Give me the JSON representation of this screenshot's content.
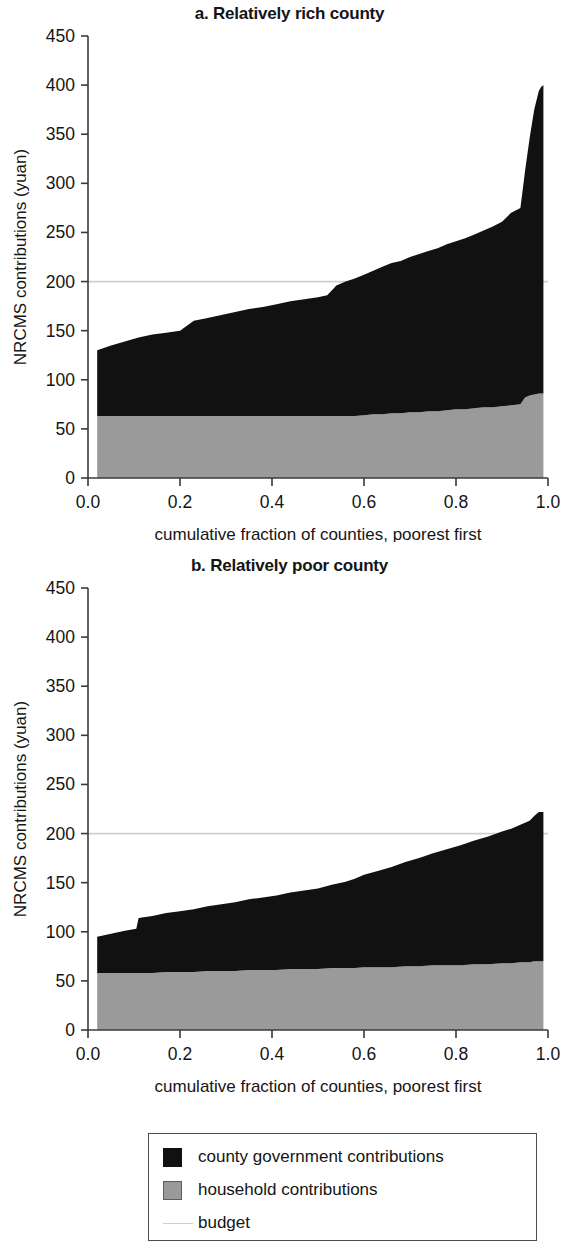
{
  "figure": {
    "background": "#ffffff"
  },
  "colors": {
    "government": "#111111",
    "household": "#9a9a9a",
    "budget": "#cfcfcf",
    "axis": "#3a3a3a",
    "text": "#151515"
  },
  "legend": {
    "items": [
      {
        "label": "county government contributions",
        "swatch": "black-square-swatch",
        "color": "#111111"
      },
      {
        "label": "household contributions",
        "swatch": "gray-square-swatch",
        "color": "#9a9a9a"
      },
      {
        "label": "budget",
        "swatch": "light-gray-line-swatch",
        "color": "#cfcfcf"
      }
    ]
  },
  "panels": [
    {
      "id": "a",
      "title": "a. Relatively rich county",
      "xlabel": "cumulative fraction of counties, poorest first",
      "ylabel": "NRCMS contributions (yuan)"
    },
    {
      "id": "b",
      "title": "b. Relatively poor county",
      "xlabel": "cumulative fraction of counties, poorest first",
      "ylabel": "NRCMS contributions (yuan)"
    }
  ],
  "axes": {
    "y_ticks": [
      "0",
      "50",
      "100",
      "150",
      "200",
      "250",
      "300",
      "350",
      "400",
      "450"
    ],
    "y_tick_values": [
      0,
      50,
      100,
      150,
      200,
      250,
      300,
      350,
      400,
      450
    ],
    "x_ticks": [
      "0.0",
      "0.2",
      "0.4",
      "0.6",
      "0.8",
      "1.0"
    ],
    "x_tick_values": [
      0.0,
      0.2,
      0.4,
      0.6,
      0.8,
      1.0
    ],
    "ylim": [
      0,
      450
    ],
    "xlim": [
      0.0,
      1.0
    ],
    "grid": false
  },
  "chart_data": [
    {
      "type": "area",
      "stacked": true,
      "title": "a. Relatively rich county",
      "xlabel": "cumulative fraction of counties, poorest first",
      "ylabel": "NRCMS contributions (yuan)",
      "xlim": [
        0.0,
        1.0
      ],
      "ylim": [
        0,
        450
      ],
      "grid": false,
      "legend_position": "below-figure",
      "budget_line": 200,
      "x": [
        0.02,
        0.05,
        0.08,
        0.11,
        0.14,
        0.17,
        0.2,
        0.23,
        0.26,
        0.29,
        0.32,
        0.35,
        0.38,
        0.41,
        0.44,
        0.47,
        0.5,
        0.52,
        0.54,
        0.56,
        0.58,
        0.6,
        0.62,
        0.64,
        0.66,
        0.68,
        0.7,
        0.72,
        0.74,
        0.76,
        0.78,
        0.8,
        0.82,
        0.84,
        0.86,
        0.88,
        0.9,
        0.92,
        0.94,
        0.95,
        0.96,
        0.97,
        0.98,
        0.985,
        0.99
      ],
      "series": [
        {
          "name": "household contributions",
          "values": [
            63,
            63,
            63,
            63,
            63,
            63,
            63,
            63,
            63,
            63,
            63,
            63,
            63,
            63,
            63,
            63,
            63,
            63,
            63,
            63,
            63,
            64,
            65,
            65,
            66,
            66,
            67,
            67,
            68,
            68,
            69,
            70,
            70,
            71,
            72,
            72,
            73,
            74,
            75,
            82,
            84,
            85,
            86,
            86,
            86
          ]
        },
        {
          "name": "county government contributions",
          "values": [
            67,
            72,
            76,
            80,
            83,
            85,
            87,
            97,
            100,
            103,
            106,
            109,
            111,
            114,
            117,
            119,
            121,
            123,
            133,
            137,
            140,
            143,
            146,
            150,
            153,
            155,
            158,
            161,
            163,
            166,
            169,
            171,
            174,
            177,
            180,
            184,
            188,
            196,
            200,
            230,
            262,
            290,
            308,
            312,
            314
          ]
        }
      ],
      "totals": [
        130,
        135,
        139,
        143,
        146,
        148,
        150,
        160,
        163,
        166,
        169,
        172,
        174,
        177,
        180,
        182,
        184,
        186,
        196,
        200,
        203,
        207,
        211,
        215,
        219,
        221,
        225,
        228,
        231,
        234,
        238,
        241,
        244,
        248,
        252,
        256,
        261,
        270,
        275,
        312,
        346,
        375,
        394,
        398,
        400
      ]
    },
    {
      "type": "area",
      "stacked": true,
      "title": "b. Relatively poor county",
      "xlabel": "cumulative fraction of counties, poorest first",
      "ylabel": "NRCMS contributions (yuan)",
      "xlim": [
        0.0,
        1.0
      ],
      "ylim": [
        0,
        450
      ],
      "grid": false,
      "legend_position": "below-figure",
      "budget_line": 200,
      "x": [
        0.02,
        0.05,
        0.08,
        0.105,
        0.11,
        0.14,
        0.17,
        0.2,
        0.23,
        0.26,
        0.29,
        0.32,
        0.35,
        0.38,
        0.41,
        0.44,
        0.47,
        0.5,
        0.53,
        0.56,
        0.58,
        0.6,
        0.63,
        0.66,
        0.69,
        0.72,
        0.75,
        0.78,
        0.81,
        0.84,
        0.87,
        0.9,
        0.92,
        0.94,
        0.96,
        0.97,
        0.98,
        0.99
      ],
      "series": [
        {
          "name": "household contributions",
          "values": [
            58,
            58,
            58,
            58,
            58,
            58,
            59,
            59,
            59,
            60,
            60,
            60,
            61,
            61,
            61,
            62,
            62,
            62,
            63,
            63,
            63,
            64,
            64,
            64,
            65,
            65,
            66,
            66,
            66,
            67,
            67,
            68,
            68,
            69,
            69,
            70,
            70,
            70
          ]
        },
        {
          "name": "county government contributions",
          "values": [
            37,
            40,
            43,
            45,
            56,
            58,
            60,
            62,
            64,
            66,
            68,
            70,
            72,
            74,
            76,
            78,
            80,
            82,
            85,
            88,
            91,
            94,
            98,
            102,
            106,
            110,
            114,
            118,
            122,
            126,
            130,
            134,
            137,
            140,
            144,
            148,
            152,
            152
          ]
        }
      ],
      "totals": [
        95,
        98,
        101,
        103,
        114,
        116,
        119,
        121,
        123,
        126,
        128,
        130,
        133,
        135,
        137,
        140,
        142,
        144,
        148,
        151,
        154,
        158,
        162,
        166,
        171,
        175,
        180,
        184,
        188,
        193,
        197,
        202,
        205,
        209,
        213,
        218,
        222,
        222
      ]
    }
  ]
}
